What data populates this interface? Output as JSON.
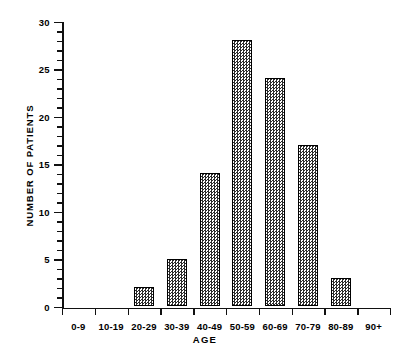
{
  "chart_data": {
    "type": "bar",
    "title": "",
    "subtitle": "",
    "xlabel": "AGE",
    "ylabel": "NUMBER OF PATIENTS",
    "categories": [
      "0-9",
      "10-19",
      "20-29",
      "30-39",
      "40-49",
      "50-59",
      "60-69",
      "70-79",
      "80-89",
      "90+"
    ],
    "values": [
      0,
      0,
      2,
      5,
      14,
      28,
      24,
      17,
      3,
      0
    ],
    "ylim": [
      0,
      30
    ],
    "y_major_ticks": [
      0,
      5,
      10,
      15,
      20,
      25,
      30
    ],
    "y_major_tick_labels": [
      "0",
      "5",
      "10",
      "15",
      "20",
      "25",
      "30"
    ],
    "y_minor_tick_interval": 1,
    "grid": false,
    "legend": null,
    "annotations": [],
    "colors": {
      "ink": "#000000",
      "background": "#ffffff",
      "bar_fill": "#2b2b2b",
      "bar_edge": "#000000"
    }
  }
}
